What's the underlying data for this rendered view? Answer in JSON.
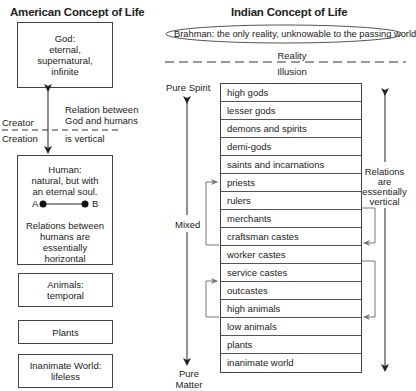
{
  "american": {
    "title": "American Concept of Life",
    "god_box": [
      "God:",
      "eternal,",
      "supernatural,",
      "infinite"
    ],
    "creator_label": "Creator",
    "creation_label": "Creation",
    "relation_text": [
      "Relation between",
      "God and humans",
      "is vertical"
    ],
    "human_box": {
      "lines": [
        "Human:",
        "natural, but with",
        "an eternal soul."
      ],
      "point_a": "A",
      "point_b": "B",
      "relations": [
        "Relations between",
        "humans are essentially",
        "horizontal"
      ]
    },
    "animals_box": [
      "Animals:",
      "temporal"
    ],
    "plants_box": [
      "Plants"
    ],
    "inanimate_box": [
      "Inanimate World:",
      "lifeless"
    ]
  },
  "indian": {
    "title": "Indian Concept of Life",
    "brahman": "Brahman: the only reality, unknowable to the passing world",
    "reality_label": "Reality",
    "illusion_label": "Illusion",
    "pure_spirit": "Pure Spirit",
    "mixed": "Mixed",
    "pure_matter": [
      "Pure",
      "Matter"
    ],
    "relations_text": [
      "Relations",
      "are",
      "essentially",
      "vertical"
    ],
    "hierarchy": [
      "high gods",
      "lesser gods",
      "demons and spirits",
      "demi-gods",
      "saints and incarnations",
      "priests",
      "rulers",
      "merchants",
      "craftsman castes",
      "worker castes",
      "service castes",
      "outcastes",
      "high animals",
      "low animals",
      "plants",
      "inanimate world"
    ]
  },
  "colors": {
    "line": "#222222",
    "bracket": "#777777",
    "box_border": "#444444"
  }
}
